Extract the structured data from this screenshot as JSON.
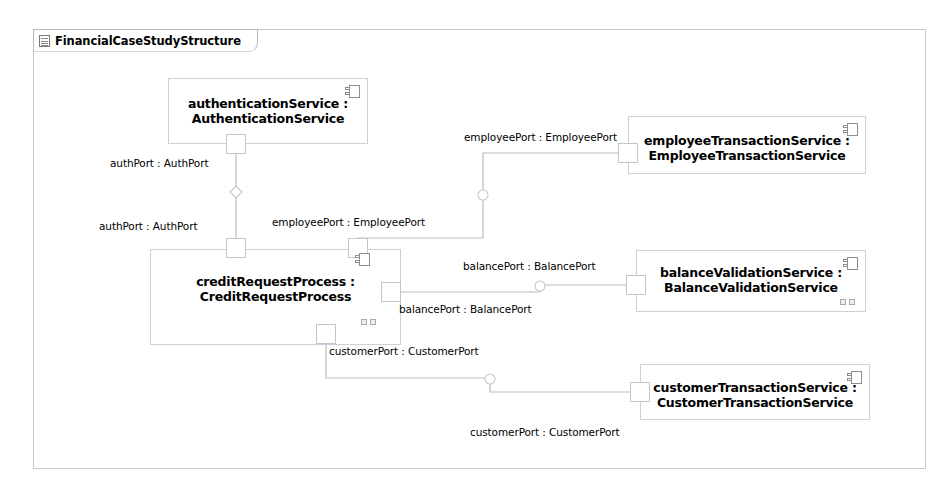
{
  "frame": {
    "label": "FinancialCaseStudyStructure",
    "icon": "diagram-icon"
  },
  "colors": {
    "frame_border": "#c9c9cc",
    "part_border": "#d0d0d4",
    "port_border": "#c5c5c9",
    "connector": "#bdbdc2",
    "text": "#000000",
    "background": "#ffffff"
  },
  "parts": [
    {
      "id": "authentication-service",
      "name": "authenticationService :",
      "type": "AuthenticationService",
      "icon": "component-icon"
    },
    {
      "id": "credit-request-process",
      "name": "creditRequestProcess :",
      "type": "CreditRequestProcess",
      "icon": "component-icon"
    },
    {
      "id": "employee-transaction-service",
      "name": "employeeTransactionService :",
      "type": "EmployeeTransactionService",
      "icon": "component-icon"
    },
    {
      "id": "balance-validation-service",
      "name": "balanceValidationService :",
      "type": "BalanceValidationService",
      "icon": "component-icon"
    },
    {
      "id": "customer-transaction-service",
      "name": "customerTransactionService :",
      "type": "CustomerTransactionService",
      "icon": "component-icon"
    }
  ],
  "port_labels": {
    "auth_top": "authPort : AuthPort",
    "auth_bottom": "authPort : AuthPort",
    "employee_left": "employeePort : EmployeePort",
    "employee_right": "employeePort : EmployeePort",
    "balance_right": "balancePort : BalancePort",
    "balance_left": "balancePort : BalancePort",
    "customer_top": "customerPort : CustomerPort",
    "customer_bottom": "customerPort : CustomerPort"
  },
  "connectors": [
    {
      "id": "auth-connector",
      "from": "authenticationService.authPort",
      "to": "creditRequestProcess.authPort",
      "marker": "diamond"
    },
    {
      "id": "employee-connector",
      "from": "creditRequestProcess.employeePort",
      "to": "employeeTransactionService.employeePort",
      "marker": "ball"
    },
    {
      "id": "balance-connector",
      "from": "creditRequestProcess.balancePort",
      "to": "balanceValidationService.balancePort",
      "marker": "ball"
    },
    {
      "id": "customer-connector",
      "from": "creditRequestProcess.customerPort",
      "to": "customerTransactionService.customerPort",
      "marker": "ball"
    }
  ]
}
